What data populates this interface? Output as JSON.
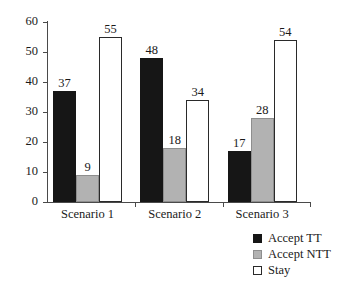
{
  "chart_data": {
    "type": "bar",
    "title": "",
    "subtitle": "",
    "xlabel": "",
    "ylabel": "",
    "ylim": [
      0,
      60
    ],
    "yticks": [
      0,
      10,
      20,
      30,
      40,
      50,
      60
    ],
    "ytick_labels": [
      "0",
      "10",
      "20",
      "30",
      "40",
      "50",
      "60"
    ],
    "grid": false,
    "legend_position": "bottom-right",
    "categories": [
      "Scenario 1",
      "Scenario 2",
      "Scenario 3"
    ],
    "series": [
      {
        "name": "Accept TT",
        "color": "#161616",
        "values": [
          37,
          48,
          17
        ],
        "labels": [
          "37",
          "48",
          "17"
        ]
      },
      {
        "name": "Accept NTT",
        "color": "#b2b2b2",
        "values": [
          9,
          18,
          28
        ],
        "labels": [
          "9",
          "18",
          "28"
        ]
      },
      {
        "name": "Stay",
        "color": "#ffffff",
        "values": [
          55,
          34,
          54
        ],
        "labels": [
          "55",
          "34",
          "54"
        ]
      }
    ]
  },
  "legend": {
    "items": [
      {
        "label": "Accept TT",
        "swatch": "black-square-icon"
      },
      {
        "label": "Accept NTT",
        "swatch": "gray-square-icon"
      },
      {
        "label": "Stay",
        "swatch": "white-square-icon"
      }
    ]
  }
}
